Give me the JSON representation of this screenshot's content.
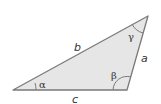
{
  "diagram": {
    "type": "triangle",
    "fill_color": "#e6e6e6",
    "stroke_color": "#7a7a7a",
    "vertices": {
      "A": [
        13,
        90
      ],
      "B": [
        127,
        90
      ],
      "C": [
        148,
        16
      ]
    },
    "sides": {
      "a": "a",
      "b": "b",
      "c": "c"
    },
    "angles": {
      "alpha": "α",
      "beta": "β",
      "gamma": "γ"
    }
  }
}
